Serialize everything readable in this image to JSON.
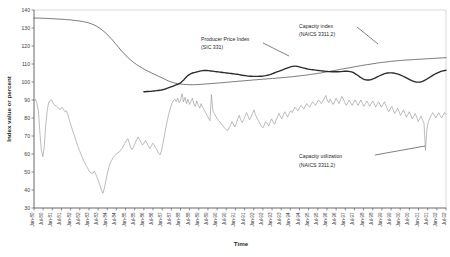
{
  "chart_data": {
    "type": "line",
    "title": "",
    "xlabel": "Time",
    "ylabel": "Index value or percent",
    "ylim": [
      30,
      140
    ],
    "ytick_step": 10,
    "yticks": [
      30,
      40,
      50,
      60,
      70,
      80,
      90,
      100,
      110,
      120,
      130,
      140
    ],
    "grid": false,
    "legend_position": "inline-annotations",
    "x_start": "Jan-80",
    "x_end": "Jul-02",
    "xticks": [
      "Jan-80",
      "Jul-80",
      "Jan-81",
      "Jul-81",
      "Jan-82",
      "Jul-82",
      "Jan-83",
      "Jul-83",
      "Jan-84",
      "Jul-84",
      "Jan-85",
      "Jul-85",
      "Jan-86",
      "Jul-86",
      "Jan-87",
      "Jul-87",
      "Jan-88",
      "Jul-88",
      "Jan-89",
      "Jul-89",
      "Jan-90",
      "Jul-90",
      "Jan-91",
      "Jul-91",
      "Jan-92",
      "Jul-92",
      "Jan-93",
      "Jul-93",
      "Jan-94",
      "Jul-94",
      "Jan-95",
      "Jul-95",
      "Jan-96",
      "Jul-96",
      "Jan-97",
      "Jul-97",
      "Jan-98",
      "Jul-98",
      "Jan-99",
      "Jul-99",
      "Jan-00",
      "Jul-00",
      "Jan-01",
      "Jul-01",
      "Jan-02",
      "Jul-02"
    ],
    "annotations": [
      {
        "name": "producer-price-index",
        "line1": "Producer Price Index",
        "line2": "(SIC 331)"
      },
      {
        "name": "capacity-index",
        "line1": "Capacity index",
        "line2": "(NAICS 3311,2)"
      },
      {
        "name": "capacity-utilization",
        "line1": "Capacity utilization",
        "line2": "(NAICS 3311,2)"
      }
    ],
    "series": [
      {
        "name": "Capacity index (NAICS 3311,2)",
        "style": "thin-line",
        "color": "#4a4a4a",
        "start_month_index": 0,
        "values": [
          135.5,
          135.5,
          135.5,
          135.5,
          135.5,
          135.4,
          135.4,
          135.4,
          135.3,
          135.3,
          135.3,
          135.2,
          135.2,
          135.1,
          135.1,
          135.0,
          135.0,
          134.9,
          134.9,
          134.8,
          134.8,
          134.7,
          134.6,
          134.6,
          134.5,
          134.4,
          134.3,
          134.2,
          134.1,
          134.0,
          133.9,
          133.8,
          133.6,
          133.5,
          133.3,
          133.1,
          132.9,
          132.6,
          132.3,
          132.0,
          131.6,
          131.2,
          130.7,
          130.2,
          129.6,
          129.0,
          128.3,
          127.6,
          126.8,
          126.0,
          125.1,
          124.2,
          123.3,
          122.3,
          121.3,
          120.3,
          119.3,
          118.3,
          117.3,
          116.4,
          115.5,
          114.6,
          113.8,
          113.0,
          112.3,
          111.6,
          110.9,
          110.3,
          109.7,
          109.1,
          108.6,
          108.1,
          107.6,
          107.1,
          106.6,
          106.2,
          105.8,
          105.4,
          105.0,
          104.6,
          104.2,
          103.8,
          103.4,
          103.0,
          102.6,
          102.2,
          101.8,
          101.4,
          101.0,
          100.6,
          100.3,
          100.0,
          99.8,
          99.5,
          99.3,
          99.1,
          99.0,
          98.9,
          98.8,
          98.7,
          98.6,
          98.6,
          98.5,
          98.5,
          98.5,
          98.5,
          98.5,
          98.5,
          98.6,
          98.6,
          98.7,
          98.7,
          98.8,
          98.8,
          98.9,
          99.0,
          99.0,
          99.1,
          99.2,
          99.2,
          99.3,
          99.4,
          99.4,
          99.5,
          99.6,
          99.6,
          99.7,
          99.8,
          99.9,
          99.9,
          100.0,
          100.1,
          100.2,
          100.2,
          100.3,
          100.4,
          100.5,
          100.5,
          100.6,
          100.7,
          100.7,
          100.8,
          100.9,
          100.9,
          101.0,
          101.1,
          101.2,
          101.2,
          101.3,
          101.4,
          101.4,
          101.5,
          101.6,
          101.6,
          101.7,
          101.8,
          101.8,
          101.9,
          102.0,
          102.0,
          102.1,
          102.2,
          102.3,
          102.3,
          102.4,
          102.5,
          102.5,
          102.6,
          102.7,
          102.8,
          102.8,
          102.9,
          103.0,
          103.1,
          103.2,
          103.3,
          103.4,
          103.5,
          103.6,
          103.7,
          103.8,
          103.9,
          104.0,
          104.2,
          104.3,
          104.4,
          104.5,
          104.6,
          104.8,
          104.9,
          105.0,
          105.2,
          105.3,
          105.5,
          105.6,
          105.8,
          105.9,
          106.1,
          106.2,
          106.4,
          106.5,
          106.7,
          106.8,
          107.0,
          107.2,
          107.3,
          107.5,
          107.6,
          107.8,
          107.9,
          108.1,
          108.2,
          108.4,
          108.5,
          108.7,
          108.8,
          109.0,
          109.1,
          109.3,
          109.4,
          109.5,
          109.7,
          109.8,
          109.9,
          110.1,
          110.2,
          110.3,
          110.5,
          110.6,
          110.7,
          110.8,
          110.9,
          111.0,
          111.1,
          111.2,
          111.3,
          111.4,
          111.5,
          111.6,
          111.7,
          111.8,
          111.8,
          111.9,
          112.0,
          112.0,
          112.1,
          112.2,
          112.2,
          112.3,
          112.3,
          112.4,
          112.4,
          112.5,
          112.5,
          112.6,
          112.6,
          112.7,
          112.7,
          112.8,
          112.8,
          112.9,
          112.9,
          113.0,
          113.0,
          113.1,
          113.1,
          113.2,
          113.2,
          113.3,
          113.3,
          113.4,
          113.4,
          113.5,
          113.5
        ]
      },
      {
        "name": "Producer Price Index (SIC 331)",
        "style": "thick-line",
        "color": "#2a2a2a",
        "start_month_index": 72,
        "values": [
          94.6,
          94.6,
          94.7,
          94.7,
          94.8,
          94.8,
          94.9,
          95.0,
          95.1,
          95.2,
          95.3,
          95.4,
          95.5,
          95.7,
          95.9,
          96.1,
          96.4,
          96.7,
          97.0,
          97.3,
          97.6,
          97.9,
          98.2,
          98.5,
          98.8,
          99.2,
          99.8,
          100.5,
          101.3,
          102.2,
          103.0,
          103.7,
          104.3,
          104.7,
          105.0,
          105.2,
          105.4,
          105.6,
          105.8,
          106.0,
          106.2,
          106.3,
          106.4,
          106.4,
          106.4,
          106.3,
          106.2,
          106.1,
          106.0,
          105.9,
          105.8,
          105.7,
          105.6,
          105.5,
          105.4,
          105.3,
          105.2,
          105.1,
          105.0,
          104.9,
          104.8,
          104.7,
          104.6,
          104.5,
          104.4,
          104.3,
          104.2,
          104.0,
          103.9,
          103.7,
          103.6,
          103.5,
          103.4,
          103.3,
          103.2,
          103.2,
          103.1,
          103.1,
          103.1,
          103.1,
          103.1,
          103.2,
          103.2,
          103.3,
          103.4,
          103.5,
          103.7,
          103.9,
          104.1,
          104.4,
          104.7,
          105.0,
          105.3,
          105.6,
          105.9,
          106.2,
          106.5,
          106.8,
          107.1,
          107.4,
          107.7,
          108.0,
          108.3,
          108.5,
          108.7,
          108.8,
          108.8,
          108.7,
          108.5,
          108.3,
          108.1,
          107.9,
          107.7,
          107.5,
          107.3,
          107.1,
          107.0,
          106.9,
          106.8,
          106.7,
          106.6,
          106.5,
          106.4,
          106.3,
          106.2,
          106.1,
          106.0,
          105.9,
          105.9,
          105.8,
          105.8,
          105.7,
          105.7,
          105.7,
          105.7,
          105.7,
          105.7,
          105.8,
          105.8,
          105.9,
          106.0,
          106.0,
          106.0,
          105.9,
          105.8,
          105.6,
          105.3,
          104.9,
          104.4,
          103.9,
          103.3,
          102.7,
          102.2,
          101.7,
          101.4,
          101.2,
          101.1,
          101.1,
          101.2,
          101.4,
          101.7,
          102.0,
          102.4,
          102.8,
          103.2,
          103.6,
          104.0,
          104.3,
          104.6,
          104.8,
          105.0,
          105.1,
          105.1,
          105.1,
          105.0,
          104.9,
          104.7,
          104.5,
          104.2,
          103.9,
          103.6,
          103.2,
          102.8,
          102.4,
          102.0,
          101.6,
          101.2,
          100.8,
          100.5,
          100.2,
          100.0,
          99.9,
          99.9,
          100.0,
          100.2,
          100.5,
          100.9,
          101.3,
          101.8,
          102.3,
          102.8,
          103.3,
          103.8,
          104.3,
          104.7,
          105.1,
          105.4,
          105.7,
          106.0,
          106.2,
          106.4,
          106.5
        ]
      },
      {
        "name": "Capacity utilization (NAICS 3311,2)",
        "style": "jagged-thin-line",
        "color": "#8f8f8f",
        "start_month_index": 0,
        "values": [
          89.5,
          90.5,
          88.0,
          84.0,
          72.0,
          62.0,
          58.5,
          64.0,
          76.0,
          84.0,
          88.5,
          89.8,
          90.0,
          88.5,
          87.2,
          86.8,
          86.0,
          85.2,
          84.8,
          86.0,
          85.0,
          83.5,
          84.0,
          82.0,
          79.0,
          76.5,
          74.0,
          71.5,
          69.0,
          66.5,
          64.0,
          62.0,
          60.0,
          58.0,
          56.0,
          54.5,
          53.0,
          51.5,
          50.0,
          49.5,
          49.0,
          50.5,
          49.0,
          47.0,
          45.0,
          42.5,
          40.0,
          38.2,
          41.0,
          45.0,
          49.0,
          52.5,
          55.0,
          56.5,
          58.0,
          59.0,
          60.0,
          60.5,
          61.0,
          62.0,
          63.0,
          64.5,
          66.0,
          67.5,
          68.5,
          66.0,
          63.5,
          62.5,
          64.0,
          66.0,
          68.0,
          69.5,
          68.0,
          66.5,
          65.0,
          66.0,
          67.5,
          66.0,
          64.5,
          63.0,
          64.5,
          66.0,
          65.0,
          63.5,
          62.0,
          60.5,
          59.5,
          62.0,
          66.0,
          70.5,
          75.0,
          79.0,
          82.5,
          85.5,
          88.0,
          89.5,
          90.5,
          89.0,
          91.0,
          88.5,
          90.0,
          93.5,
          89.0,
          91.5,
          88.0,
          90.5,
          87.5,
          89.0,
          91.0,
          88.0,
          86.5,
          89.5,
          87.0,
          85.5,
          88.0,
          86.0,
          84.5,
          83.0,
          81.5,
          80.0,
          78.5,
          93.0,
          84.0,
          82.5,
          81.0,
          79.5,
          78.5,
          77.5,
          76.5,
          75.5,
          74.5,
          73.5,
          73.0,
          74.5,
          76.0,
          78.0,
          76.5,
          75.0,
          77.0,
          79.5,
          81.5,
          79.0,
          77.5,
          79.0,
          81.0,
          83.0,
          81.0,
          79.0,
          80.5,
          82.5,
          84.5,
          82.0,
          80.0,
          78.5,
          77.0,
          75.5,
          74.5,
          76.0,
          78.0,
          77.0,
          75.5,
          77.5,
          79.5,
          78.0,
          76.5,
          78.5,
          80.5,
          82.5,
          81.0,
          79.5,
          81.5,
          83.5,
          82.0,
          80.5,
          82.5,
          84.0,
          83.0,
          84.5,
          86.0,
          85.0,
          84.0,
          85.5,
          87.0,
          86.0,
          85.0,
          86.5,
          88.0,
          87.0,
          86.0,
          87.5,
          89.0,
          88.0,
          87.0,
          88.5,
          90.0,
          89.0,
          88.0,
          89.5,
          91.0,
          92.5,
          90.0,
          88.5,
          90.5,
          89.0,
          87.5,
          89.0,
          91.0,
          89.5,
          88.0,
          90.0,
          92.0,
          90.5,
          88.5,
          87.0,
          88.5,
          90.0,
          88.5,
          87.0,
          88.5,
          90.0,
          88.5,
          87.0,
          88.5,
          90.0,
          88.0,
          86.5,
          88.0,
          89.5,
          88.0,
          86.5,
          88.0,
          89.5,
          88.0,
          86.0,
          87.5,
          89.0,
          87.5,
          86.0,
          87.5,
          89.0,
          87.0,
          85.0,
          83.5,
          85.0,
          86.5,
          84.5,
          82.5,
          84.0,
          85.5,
          83.5,
          81.5,
          83.0,
          84.5,
          82.5,
          80.5,
          82.0,
          83.5,
          81.5,
          79.5,
          81.0,
          82.5,
          80.5,
          78.0,
          79.5,
          81.0,
          79.0,
          77.0,
          62.0,
          74.0,
          78.0,
          80.0,
          81.5,
          83.0,
          81.5,
          80.0,
          81.5,
          83.0,
          81.5,
          80.0,
          81.5,
          83.0,
          82.0
        ]
      }
    ]
  }
}
